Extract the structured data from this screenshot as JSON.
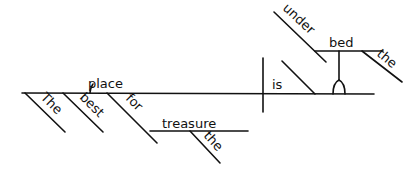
{
  "diagram": {
    "type": "sentence-diagram",
    "sentence": "The best place for treasure is under the bed",
    "subject": "place",
    "verb": "is",
    "modifiers_subject": [
      "The",
      "best"
    ],
    "prepositional_phrase_subject": {
      "preposition": "for",
      "object": "treasure",
      "object_modifier": "the"
    },
    "predicate_phrase": {
      "preposition": "under",
      "object": "bed",
      "object_modifier": "the"
    }
  },
  "words": {
    "place": "place",
    "the1": "The",
    "best": "best",
    "for": "for",
    "treasure": "treasure",
    "the2": "the",
    "is": "is",
    "under": "under",
    "bed": "bed",
    "the3": "the"
  }
}
